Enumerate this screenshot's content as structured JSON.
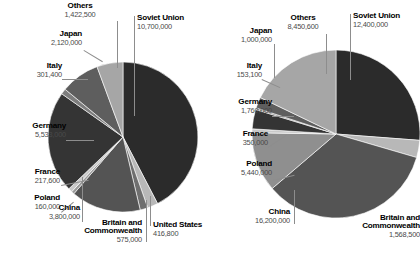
{
  "figure": {
    "background": "#ffffff",
    "label_color": "#000000",
    "value_color": "#4a4a4a",
    "leader_color": "#8d8d8d"
  },
  "palette": {
    "soviet_union": "#2b2b2b",
    "britain": "#b8b8b8",
    "united_states": "#6f6f6f",
    "china": "#545454",
    "poland": "#9a9a9a",
    "france": "#c9c9c9",
    "germany": "#343434",
    "italy": "#7d7d7d",
    "japan": "#5e5e5e",
    "others": "#a6a6a6"
  },
  "chart_data": [
    {
      "id": "left",
      "type": "pie",
      "title": "",
      "total": 25246300,
      "start_angle_deg": 0,
      "direction": "clockwise",
      "categories": [
        "Soviet Union",
        "Britain and Commonwealth",
        "United States",
        "China",
        "Poland",
        "France",
        "Germany",
        "Italy",
        "Japan",
        "Others"
      ],
      "values": [
        10700000,
        575000,
        416800,
        3800000,
        160000,
        217600,
        5533000,
        301400,
        2120000,
        1422500
      ],
      "value_labels": [
        "10,700,000",
        "575,000",
        "416,800",
        "3,800,000",
        "160,000",
        "217,600",
        "5,533,000",
        "301,400",
        "2,120,000",
        "1,422,500"
      ],
      "slices": [
        {
          "name": "Soviet Union",
          "value": 10700000,
          "value_label": "10,700,000",
          "color": "#2b2b2b"
        },
        {
          "name": "Britain and Commonwealth",
          "value": 575000,
          "value_label": "575,000",
          "color": "#b8b8b8"
        },
        {
          "name": "United States",
          "value": 416800,
          "value_label": "416,800",
          "color": "#6f6f6f"
        },
        {
          "name": "China",
          "value": 3800000,
          "value_label": "3,800,000",
          "color": "#545454"
        },
        {
          "name": "Poland",
          "value": 160000,
          "value_label": "160,000",
          "color": "#9a9a9a"
        },
        {
          "name": "France",
          "value": 217600,
          "value_label": "217,600",
          "color": "#c9c9c9"
        },
        {
          "name": "Germany",
          "value": 5533000,
          "value_label": "5,533,000",
          "color": "#343434"
        },
        {
          "name": "Italy",
          "value": 301400,
          "value_label": "301,400",
          "color": "#7d7d7d"
        },
        {
          "name": "Japan",
          "value": 2120000,
          "value_label": "2,120,000",
          "color": "#5e5e5e"
        },
        {
          "name": "Others",
          "value": 1422500,
          "value_label": "1,422,500",
          "color": "#a6a6a6"
        }
      ]
    },
    {
      "id": "right",
      "type": "pie",
      "title": "",
      "total": 47322200,
      "start_angle_deg": 0,
      "direction": "clockwise",
      "categories": [
        "Soviet Union",
        "Britain and Commonwealth",
        "China",
        "Poland",
        "France",
        "Germany",
        "Italy",
        "Japan",
        "Others"
      ],
      "values": [
        12400000,
        1568500,
        16200000,
        5440000,
        350000,
        1760000,
        153100,
        1000000,
        8450600
      ],
      "value_labels": [
        "12,400,000",
        "1,568,500",
        "16,200,000",
        "5,440,000",
        "350,000",
        "1,760,000",
        "153,100",
        "1,000,000",
        "8,450,600"
      ],
      "slices": [
        {
          "name": "Soviet Union",
          "value": 12400000,
          "value_label": "12,400,000",
          "color": "#2b2b2b"
        },
        {
          "name": "Britain and Commonwealth",
          "value": 1568500,
          "value_label": "1,568,500",
          "color": "#b8b8b8"
        },
        {
          "name": "China",
          "value": 16200000,
          "value_label": "16,200,000",
          "color": "#545454"
        },
        {
          "name": "Poland",
          "value": 5440000,
          "value_label": "5,440,000",
          "color": "#8f8f8f"
        },
        {
          "name": "France",
          "value": 350000,
          "value_label": "350,000",
          "color": "#c9c9c9"
        },
        {
          "name": "Germany",
          "value": 1760000,
          "value_label": "1,760,000",
          "color": "#343434"
        },
        {
          "name": "Italy",
          "value": 153100,
          "value_label": "153,100",
          "color": "#7d7d7d"
        },
        {
          "name": "Japan",
          "value": 1000000,
          "value_label": "1,000,000",
          "color": "#5e5e5e"
        },
        {
          "name": "Others",
          "value": 8450600,
          "value_label": "8,450,600",
          "color": "#a6a6a6"
        }
      ]
    }
  ],
  "left_chart": {
    "labels": {
      "others_name": "Others",
      "others_value": "1,422,500",
      "soviet_name": "Soviet Union",
      "soviet_value": "10,700,000",
      "japan_name": "Japan",
      "japan_value": "2,120,000",
      "italy_name": "Italy",
      "italy_value": "301,400",
      "germany_name": "Germany",
      "germany_value": "5,533,000",
      "france_name": "France",
      "france_value": "217,600",
      "poland_name": "Poland",
      "poland_value": "160,000",
      "china_name": "China",
      "china_value": "3,800,000",
      "britain_name_line1": "Britain and",
      "britain_name_line2": "Commonwealth",
      "britain_value": "575,000",
      "us_name": "United States",
      "us_value": "416,800"
    }
  },
  "right_chart": {
    "labels": {
      "others_name": "Others",
      "others_value": "8,450,600",
      "soviet_name": "Soviet Union",
      "soviet_value": "12,400,000",
      "japan_name": "Japan",
      "japan_value": "1,000,000",
      "italy_name": "Italy",
      "italy_value": "153,100",
      "germany_name": "Germany",
      "germany_value": "1,760,000",
      "france_name": "France",
      "france_value": "350,000",
      "poland_name": "Poland",
      "poland_value": "5,440,000",
      "china_name": "China",
      "china_value": "16,200,000",
      "britain_name_line1": "Britain and",
      "britain_name_line2": "Commonwealth",
      "britain_value": "1,568,500"
    }
  }
}
